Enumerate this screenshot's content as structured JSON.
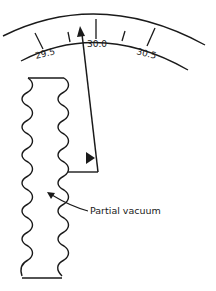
{
  "diagram": {
    "scale": {
      "ticks": [
        {
          "label": "29.5",
          "major": true
        },
        {
          "label": "",
          "major": false
        },
        {
          "label": "30.0",
          "major": true
        },
        {
          "label": "",
          "major": false
        },
        {
          "label": "30.5",
          "major": true
        }
      ]
    },
    "labels": {
      "bellows": "Partial vacuum"
    },
    "colors": {
      "line": "#1a1a1a",
      "background": "#ffffff"
    }
  }
}
